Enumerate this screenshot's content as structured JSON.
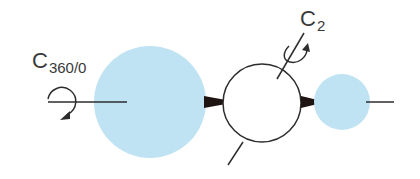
{
  "diagram": {
    "type": "symmetry-operation-schematic",
    "labels": {
      "c360": {
        "main": "C",
        "sub": "360/0"
      },
      "c2": {
        "main": "C",
        "sub": "2"
      }
    },
    "colors": {
      "atom_fill": "#bfe3f3",
      "line": "#2d2d2d",
      "wedge": "#1e1412",
      "label": "#3a3a3a",
      "background": "#ffffff"
    },
    "elements": [
      {
        "name": "large-blue-atom",
        "shape": "circle",
        "cx": 150,
        "cy": 102,
        "r": 56
      },
      {
        "name": "central-white-atom",
        "shape": "circle",
        "cx": 262,
        "cy": 103,
        "r": 39
      },
      {
        "name": "small-blue-atom",
        "shape": "circle",
        "cx": 342,
        "cy": 102,
        "r": 28
      }
    ]
  }
}
